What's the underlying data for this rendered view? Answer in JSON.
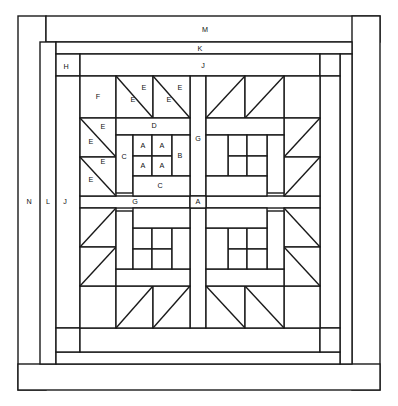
{
  "diagram": {
    "type": "quilt-block-assembly",
    "width": 398,
    "height": 406,
    "stroke_color": "#1a1a1a",
    "fill_color": "#ffffff"
  },
  "labels": {
    "A": "A",
    "B": "B",
    "C": "C",
    "D": "D",
    "E": "E",
    "F": "F",
    "G": "G",
    "H": "H",
    "J": "J",
    "K": "K",
    "L": "L",
    "M": "M",
    "N": "N"
  },
  "annotations": [
    {
      "id": "M",
      "text": "M",
      "x": 205,
      "y": 30,
      "piece": "outer-border-top"
    },
    {
      "id": "K",
      "text": "K",
      "x": 200,
      "y": 49,
      "piece": "border-strip-k"
    },
    {
      "id": "J",
      "text": "J",
      "x": 203,
      "y": 66,
      "piece": "sashing-j-top"
    },
    {
      "id": "H",
      "text": "H",
      "x": 66,
      "y": 67,
      "piece": "corner-square-h"
    },
    {
      "id": "N",
      "text": "N",
      "x": 29,
      "y": 202,
      "piece": "outer-border-left"
    },
    {
      "id": "L",
      "text": "L",
      "x": 48,
      "y": 202,
      "piece": "border-strip-l"
    },
    {
      "id": "J2",
      "text": "J",
      "x": 65,
      "y": 202,
      "piece": "sashing-j-left"
    },
    {
      "id": "F",
      "text": "F",
      "x": 98,
      "y": 97,
      "piece": "corner-square-f"
    },
    {
      "id": "E1",
      "text": "E",
      "x": 131,
      "y": 100,
      "piece": "half-square-triangle"
    },
    {
      "id": "E2",
      "text": "E",
      "x": 143,
      "y": 89,
      "piece": "half-square-triangle"
    },
    {
      "id": "E3",
      "text": "E",
      "x": 163,
      "y": 100,
      "piece": "half-square-triangle"
    },
    {
      "id": "E4",
      "text": "E",
      "x": 175,
      "y": 89,
      "piece": "half-square-triangle"
    },
    {
      "id": "E5",
      "text": "E",
      "x": 102,
      "y": 127,
      "piece": "half-square-triangle"
    },
    {
      "id": "E6",
      "text": "E",
      "x": 91,
      "y": 142,
      "piece": "half-square-triangle"
    },
    {
      "id": "E7",
      "text": "E",
      "x": 102,
      "y": 160,
      "piece": "half-square-triangle"
    },
    {
      "id": "E8",
      "text": "E",
      "x": 91,
      "y": 176,
      "piece": "half-square-triangle"
    },
    {
      "id": "D",
      "text": "D",
      "x": 154,
      "y": 126,
      "piece": "rectangle-d"
    },
    {
      "id": "C1",
      "text": "C",
      "x": 124,
      "y": 156,
      "piece": "rectangle-c-left"
    },
    {
      "id": "C2",
      "text": "C",
      "x": 159,
      "y": 185,
      "piece": "rectangle-c-bottom"
    },
    {
      "id": "B",
      "text": "B",
      "x": 180,
      "y": 156,
      "piece": "rectangle-b"
    },
    {
      "id": "A1",
      "text": "A",
      "x": 143,
      "y": 146,
      "piece": "four-patch-square"
    },
    {
      "id": "A2",
      "text": "A",
      "x": 162,
      "y": 146,
      "piece": "four-patch-square"
    },
    {
      "id": "A3",
      "text": "A",
      "x": 143,
      "y": 165,
      "piece": "four-patch-square"
    },
    {
      "id": "A4",
      "text": "A",
      "x": 162,
      "y": 165,
      "piece": "four-patch-square"
    },
    {
      "id": "G1",
      "text": "G",
      "x": 198,
      "y": 139,
      "piece": "sashing-g-vertical"
    },
    {
      "id": "G2",
      "text": "G",
      "x": 135,
      "y": 202,
      "piece": "sashing-g-horizontal"
    },
    {
      "id": "A5",
      "text": "A",
      "x": 198,
      "y": 202,
      "piece": "sashing-center-square-a"
    }
  ],
  "legend_pieces": [
    {
      "code": "A",
      "name": "small square"
    },
    {
      "code": "B",
      "name": "side rectangle"
    },
    {
      "code": "C",
      "name": "corner rectangle"
    },
    {
      "code": "D",
      "name": "top rectangle"
    },
    {
      "code": "E",
      "name": "half-square triangle"
    },
    {
      "code": "F",
      "name": "plain square"
    },
    {
      "code": "G",
      "name": "sashing strip"
    },
    {
      "code": "H",
      "name": "corner square"
    },
    {
      "code": "J",
      "name": "inner border strip"
    },
    {
      "code": "K",
      "name": "middle border strip"
    },
    {
      "code": "L",
      "name": "narrow border strip"
    },
    {
      "code": "M",
      "name": "outer border strip"
    },
    {
      "code": "N",
      "name": "outer binding strip"
    }
  ]
}
